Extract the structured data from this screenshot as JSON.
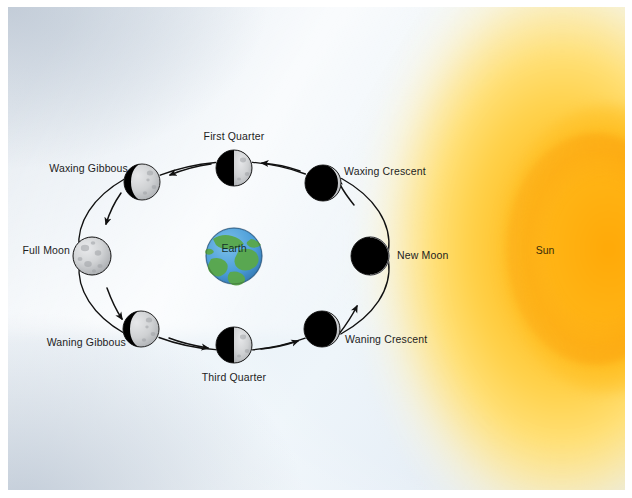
{
  "figure": {
    "background_color": "#e9f0f7",
    "paper_color": "#ffffff"
  },
  "sun": {
    "label": "Sun",
    "x": 545,
    "y": 243,
    "core_color": "#ffb521",
    "edge_color": "#ffa908",
    "glow_color": "#ffe796"
  },
  "earth": {
    "label": "Earth",
    "x": 226,
    "y": 249,
    "radius": 28,
    "ocean_color": "#4a9cd8",
    "land_color": "#5aa84c"
  },
  "orbit": {
    "center_x": 226,
    "center_y": 249,
    "radius_x": 143,
    "radius_y": 88,
    "stroke_color": "#111111",
    "direction": "counterclockwise"
  },
  "phases": [
    {
      "name": "New Moon",
      "illumination_percent": 0,
      "lit_side": "none",
      "x": 362,
      "y": 249,
      "radius": 19,
      "label": "New Moon",
      "label_x": 389,
      "label_y": 249,
      "label_align": "left"
    },
    {
      "name": "Waxing Crescent",
      "illumination_percent": 8,
      "lit_side": "right",
      "x": 315,
      "y": 176,
      "radius": 18,
      "label": "Waxing Crescent",
      "label_x": 336,
      "label_y": 165,
      "label_align": "left"
    },
    {
      "name": "First Quarter",
      "illumination_percent": 50,
      "lit_side": "right",
      "x": 226,
      "y": 161,
      "radius": 18,
      "label": "First Quarter",
      "label_x": 226,
      "label_y": 130,
      "label_align": "center"
    },
    {
      "name": "Waxing Gibbous",
      "illumination_percent": 78,
      "lit_side": "right",
      "x": 134,
      "y": 175,
      "radius": 18,
      "label": "Waxing Gibbous",
      "label_x": 120,
      "label_y": 162,
      "label_align": "right"
    },
    {
      "name": "Full Moon",
      "illumination_percent": 100,
      "lit_side": "all",
      "x": 84,
      "y": 249,
      "radius": 19,
      "label": "Full Moon",
      "label_x": 62,
      "label_y": 244,
      "label_align": "right"
    },
    {
      "name": "Waning Gibbous",
      "illumination_percent": 78,
      "lit_side": "right",
      "x": 133,
      "y": 322,
      "radius": 18,
      "label": "Waning Gibbous",
      "label_x": 118,
      "label_y": 336,
      "label_align": "right"
    },
    {
      "name": "Third Quarter",
      "illumination_percent": 50,
      "lit_side": "right",
      "x": 226,
      "y": 338,
      "radius": 18,
      "label": "Third Quarter",
      "label_x": 226,
      "label_y": 371,
      "label_align": "center"
    },
    {
      "name": "Waning Crescent",
      "illumination_percent": 10,
      "lit_side": "right",
      "x": 314,
      "y": 322,
      "radius": 18,
      "label": "Waning Crescent",
      "label_x": 337,
      "label_y": 333,
      "label_align": "left"
    }
  ],
  "colors": {
    "moon_dark": "#000000",
    "moon_lit": "#c9cbcd",
    "moon_outline": "#1a1a1a",
    "label_text": "#1d1d1d",
    "sky_light": "#eef5fa",
    "sky_dark": "#b9c6d4"
  }
}
